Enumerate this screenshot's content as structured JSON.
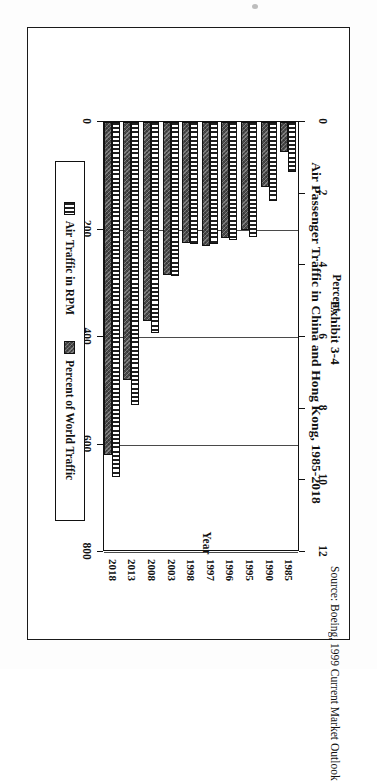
{
  "figure": {
    "exhibit_label": "Exhibit 3-4",
    "title": "Air Passenger Traffic in China and Hong Kong, 1985-2018",
    "source_note": "Source:  Boeing, 1999 Current Market Outlook"
  },
  "legend": {
    "position": "bottom",
    "items": [
      {
        "label": "Air Traffic in RPM",
        "swatch": "striped-vertical"
      },
      {
        "label": "Percent of World Traffic",
        "swatch": "solid-dark-hatch"
      }
    ]
  },
  "axes": {
    "x_title": "Year",
    "left_title": "RPKs in Millions",
    "right_title": "Percent",
    "left_ticks": [
      "0",
      "200",
      "400",
      "600",
      "800"
    ],
    "right_ticks": [
      "0",
      "2",
      "4",
      "6",
      "8",
      "10",
      "12"
    ]
  },
  "colors": {
    "ink": "#111111",
    "bar_rpm_fill": "#ffffff",
    "bar_rpm_stripe": "#1f1f1f",
    "bar_pct_fill": "#4a4a4a",
    "frame": "#1a1a1a"
  },
  "chart_data": {
    "type": "bar",
    "orientation": "vertical",
    "title": "Air Passenger Traffic in China and Hong Kong, 1985-2018",
    "subtitle": "Exhibit 3-4",
    "xlabel": "Year",
    "ylabel": "RPKs in Millions",
    "y2label": "Percent",
    "categories": [
      "1985",
      "1990",
      "1995",
      "1996",
      "1997",
      "1998",
      "2003",
      "2008",
      "2013",
      "2018"
    ],
    "ylim": [
      0,
      800
    ],
    "y2lim": [
      0,
      12
    ],
    "grid": true,
    "legend_position": "bottom",
    "series": [
      {
        "name": "Air Traffic in RPM",
        "axis": "y2",
        "unit": "percent",
        "values": [
          1.4,
          2.2,
          3.2,
          3.3,
          3.4,
          3.4,
          4.3,
          5.9,
          7.9,
          9.9
        ]
      },
      {
        "name": "Percent of World Traffic",
        "axis": "y1",
        "unit": "RPKs in Millions",
        "values": [
          55,
          120,
          200,
          215,
          230,
          225,
          285,
          370,
          480,
          620
        ]
      }
    ]
  }
}
